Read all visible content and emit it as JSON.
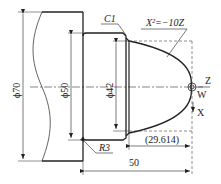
{
  "figure": {
    "type": "lathe part technical drawing",
    "labels": {
      "dia_70": "ϕ70",
      "dia_50": "ϕ50",
      "dia_42": "ϕ42",
      "chamfer": "C1",
      "curve_eq": "X²=−10Z",
      "fillet": "R3",
      "len_parabola": "(29.614)",
      "len_total": "50",
      "axis_z": "Z",
      "axis_x": "X",
      "origin": "W"
    },
    "colors": {
      "line": "#222222",
      "background": "#ffffff"
    }
  }
}
